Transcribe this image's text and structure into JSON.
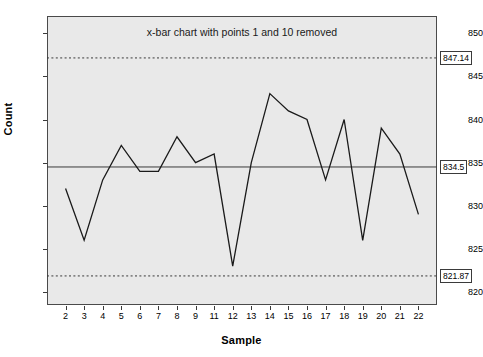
{
  "chart_data": {
    "type": "line",
    "title": "x-bar chart with points 1 and 10 removed",
    "xlabel": "Sample",
    "ylabel": "Count",
    "categories": [
      "2",
      "3",
      "4",
      "5",
      "6",
      "7",
      "8",
      "9",
      "11",
      "12",
      "13",
      "14",
      "15",
      "16",
      "17",
      "18",
      "19",
      "20",
      "21",
      "22"
    ],
    "values": [
      832,
      826,
      833,
      837,
      834,
      834,
      838,
      835,
      836,
      823,
      835,
      843,
      841,
      840,
      833,
      840,
      826,
      839,
      836,
      829
    ],
    "series": [
      {
        "name": "x-bar",
        "values": [
          832,
          826,
          833,
          837,
          834,
          834,
          838,
          835,
          836,
          823,
          835,
          843,
          841,
          840,
          833,
          840,
          826,
          839,
          836,
          829
        ]
      }
    ],
    "ylim": [
      818.5,
      852
    ],
    "yticks": [
      820,
      825,
      830,
      835,
      840,
      845,
      850
    ],
    "ytick_labels": [
      "820",
      "825",
      "830",
      "835",
      "840",
      "845",
      "850"
    ],
    "grid": false,
    "legend": "none",
    "control_limits": {
      "ucl": {
        "value": 847.14,
        "label": "847.14",
        "style": "dotted"
      },
      "center": {
        "value": 834.5,
        "label": "834.5",
        "style": "solid"
      },
      "lcl": {
        "value": 821.87,
        "label": "821.87",
        "style": "dotted"
      }
    },
    "colors": {
      "plot_background": "#e9e9e9",
      "page_background": "#ffffff",
      "series_line": "#1a1a1a",
      "limit_line": "#3a3a3a",
      "axis": "#3a3a3a",
      "text": "#000000"
    }
  }
}
